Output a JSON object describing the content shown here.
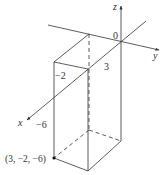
{
  "figure": {
    "axes": {
      "x_label": "x",
      "y_label": "y",
      "z_label": "z",
      "origin_label": "0"
    },
    "dimension_labels": {
      "x_length": "3",
      "y_length": "−2",
      "z_length": "−6"
    },
    "point": {
      "label": "(3, −2, −6)",
      "coords": [
        3,
        -2,
        -6
      ]
    },
    "colors": {
      "line": "#333333",
      "background": "#ffffff"
    }
  }
}
